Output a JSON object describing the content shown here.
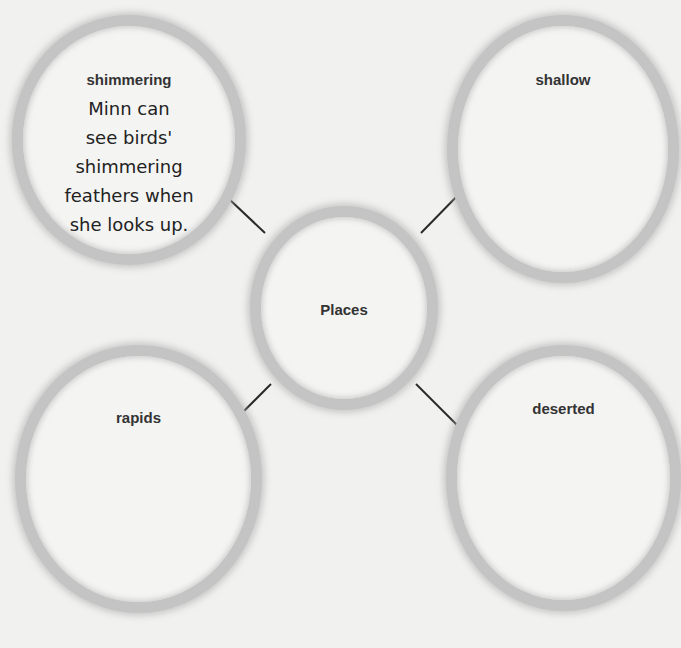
{
  "web": {
    "center": {
      "label": "Places"
    },
    "nodes": [
      {
        "position": "top-left",
        "label": "shimmering",
        "answer_lines": [
          "Minn can",
          "see birds'",
          "shimmering",
          "feathers when",
          "she looks up."
        ]
      },
      {
        "position": "top-right",
        "label": "shallow"
      },
      {
        "position": "bottom-left",
        "label": "rapids"
      },
      {
        "position": "bottom-right",
        "label": "deserted"
      }
    ]
  },
  "colors": {
    "background": "#f1f1f0",
    "ring": "#c4c4c4",
    "connector": "#2a2a2a",
    "text": "#333333"
  }
}
